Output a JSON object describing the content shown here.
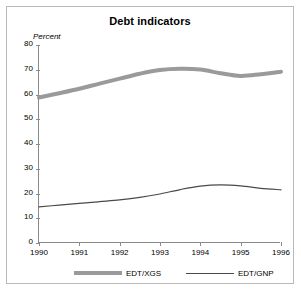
{
  "chart_data": {
    "type": "line",
    "title": "Debt indicators",
    "xlabel": "",
    "ylabel": "Percent",
    "ylim": [
      0,
      80
    ],
    "xlim": [
      1990,
      1996
    ],
    "yticks": [
      0,
      10,
      20,
      30,
      40,
      50,
      60,
      70,
      80
    ],
    "xticks": [
      "1990",
      "1991",
      "1992",
      "1993",
      "1994",
      "1995",
      "1996"
    ],
    "grid": false,
    "legend_position": "below",
    "x": [
      1990,
      1990.5,
      1991,
      1991.5,
      1992,
      1992.5,
      1993,
      1993.5,
      1994,
      1994.5,
      1995,
      1995.5,
      1996
    ],
    "series": [
      {
        "name": "EDT/XGS",
        "color": "#9a9a9a",
        "style": "thick",
        "values": [
          58.8,
          60.5,
          62.3,
          64.4,
          66.4,
          68.4,
          69.9,
          70.4,
          70.1,
          68.6,
          67.5,
          68.2,
          69.2
        ]
      },
      {
        "name": "EDT/GNP",
        "color": "#4a4a4a",
        "style": "thin",
        "values": [
          14.6,
          15.3,
          16.0,
          16.7,
          17.4,
          18.4,
          19.8,
          21.6,
          23.0,
          23.5,
          23.1,
          22.1,
          21.5
        ]
      }
    ]
  },
  "legend": {
    "entries": [
      {
        "label": "EDT/XGS"
      },
      {
        "label": "EDT/GNP"
      }
    ]
  }
}
